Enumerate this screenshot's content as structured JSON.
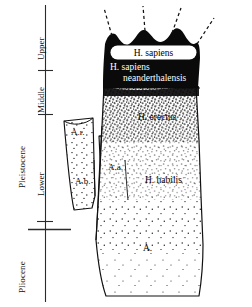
{
  "figure": {
    "kind": "hominid-phylogeny-diagram",
    "background": "#ffffff",
    "ink": "#000000"
  },
  "time_axis": {
    "orientation": "vertical",
    "epochs": [
      {
        "id": "pleistocene",
        "label": "Pleistocene"
      },
      {
        "id": "pliocene",
        "label": "Pliocene"
      }
    ],
    "subdivisions": [
      {
        "id": "upper",
        "label": "Upper"
      },
      {
        "id": "middle",
        "label": "Middle"
      },
      {
        "id": "lower",
        "label": "Lower"
      }
    ],
    "tick_marks": 2,
    "epoch_boundary_rule": 1
  },
  "taxa": [
    {
      "id": "h-sapiens",
      "label": "H. sapiens",
      "style": "boxed-white"
    },
    {
      "id": "h-sapiens-neander-1",
      "label": "H. sapiens",
      "style": "white-on-black"
    },
    {
      "id": "h-sapiens-neander-2",
      "label": "neanderthalensis",
      "style": "white-on-black"
    },
    {
      "id": "h-erectus",
      "label": "H. erectus",
      "style": "black-on-stipple"
    },
    {
      "id": "h-habilis",
      "label": "H. habilis",
      "style": "black-on-stipple"
    },
    {
      "id": "a-robustus",
      "label": "A.r.",
      "style": "black-on-stipple"
    },
    {
      "id": "a-africanus",
      "label": "A.a.",
      "style": "black-on-stipple"
    },
    {
      "id": "a-boisei",
      "label": "A.b.",
      "style": "black-on-stipple"
    },
    {
      "id": "australopithecus",
      "label": "A.",
      "style": "black-on-stipple"
    }
  ],
  "branches": {
    "dashed_projections": 4,
    "side_branch_count": 3,
    "main_trunk": "australopithecus-to-sapiens"
  }
}
